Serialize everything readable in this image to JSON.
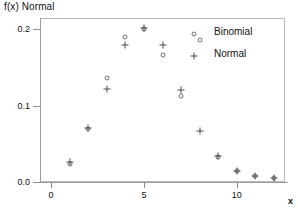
{
  "chart_data": {
    "type": "scatter",
    "title": "f(x) Normal",
    "xlabel": "x",
    "ylabel": "",
    "xlim": [
      -0.6,
      12.6
    ],
    "ylim": [
      0.0,
      0.215
    ],
    "grid": false,
    "legend_position": "top-right",
    "x": [
      1,
      2,
      3,
      4,
      5,
      6,
      7,
      8,
      9,
      10,
      11,
      12
    ],
    "xticks": [
      0,
      5,
      10
    ],
    "xtick_labels": [
      "0",
      "5",
      "10"
    ],
    "yticks": [
      0.0,
      0.1,
      0.2
    ],
    "ytick_labels": [
      "0.0",
      "0.1",
      "0.2"
    ],
    "series": [
      {
        "name": "Binomial",
        "marker": "circle",
        "values": [
          0.024,
          0.07,
          0.136,
          0.19,
          0.2,
          0.167,
          0.113,
          0.186,
          0.033,
          0.015,
          0.008,
          0.005
        ]
      },
      {
        "name": "Normal",
        "marker": "plus",
        "values": [
          0.026,
          0.071,
          0.122,
          0.18,
          0.202,
          0.18,
          0.121,
          0.067,
          0.034,
          0.015,
          0.008,
          0.005
        ]
      }
    ]
  },
  "legend": {
    "entries": [
      {
        "label": "Binomial",
        "marker": "circle"
      },
      {
        "label": "Normal",
        "marker": "plus"
      }
    ]
  },
  "axis": {
    "x_label": "x",
    "y_label": ""
  }
}
